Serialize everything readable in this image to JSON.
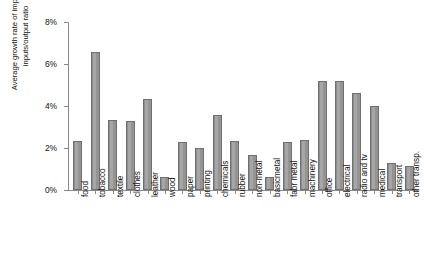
{
  "chart_data": {
    "type": "bar",
    "title": "",
    "xlabel": "",
    "ylabel": "Average growth rate of imported\ninputs/output ratio",
    "ylabel_lines": [
      "Average growth rate of imported",
      "inputs/output ratio"
    ],
    "ylim": [
      0,
      8
    ],
    "ytick_labels": [
      "0%",
      "2%",
      "4%",
      "6%",
      "8%"
    ],
    "ytick_values": [
      0,
      2,
      4,
      6,
      8
    ],
    "grid": false,
    "legend": null,
    "units": "percent",
    "bar_color": "#9c9c9c",
    "bar_edge_color": "#6f6f6f",
    "axis_color": "#8a8a8a",
    "categories": [
      "food",
      "tobacco",
      "textile",
      "clothes",
      "leather",
      "wood",
      "paper",
      "printing",
      "chemicals",
      "rubber",
      "non-metal",
      "basicmetal",
      "fabr metal",
      "machinery",
      "office",
      "electrical",
      "radio and tv",
      "medical",
      "transport",
      "other transp."
    ],
    "values": [
      2.35,
      6.55,
      3.35,
      3.3,
      4.35,
      0.62,
      2.3,
      2.0,
      3.55,
      2.35,
      1.65,
      0.6,
      2.3,
      2.4,
      5.2,
      5.2,
      4.6,
      4.0,
      1.3,
      1.15
    ]
  }
}
